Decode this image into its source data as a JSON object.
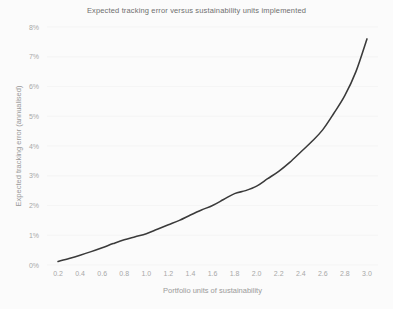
{
  "chart_data": {
    "type": "line",
    "title": "Expected tracking error versus sustainability units implemented",
    "xlabel": "Portfolio units of sustainability",
    "ylabel": "Expected tracking error (annualised)",
    "xlim": [
      0.1,
      3.1
    ],
    "ylim": [
      0,
      8
    ],
    "grid": true,
    "legend": "none",
    "x_tick_labels": [
      "0.2",
      "0.4",
      "0.6",
      "0.8",
      "1.0",
      "1.2",
      "1.4",
      "1.6",
      "1.8",
      "2.0",
      "2.2",
      "2.4",
      "2.6",
      "2.8",
      "3.0"
    ],
    "x_tick_values": [
      0.2,
      0.4,
      0.6,
      0.8,
      1.0,
      1.2,
      1.4,
      1.6,
      1.8,
      2.0,
      2.2,
      2.4,
      2.6,
      2.8,
      3.0
    ],
    "y_tick_labels": [
      "0%",
      "1%",
      "2%",
      "3%",
      "4%",
      "5%",
      "6%",
      "7%",
      "8%"
    ],
    "y_tick_values": [
      0,
      1,
      2,
      3,
      4,
      5,
      6,
      7,
      8
    ],
    "series": [
      {
        "name": "Expected tracking error",
        "color": "#3a3a3a",
        "x": [
          0.2,
          0.3,
          0.4,
          0.5,
          0.6,
          0.7,
          0.8,
          0.9,
          1.0,
          1.1,
          1.2,
          1.3,
          1.4,
          1.5,
          1.6,
          1.7,
          1.8,
          1.9,
          2.0,
          2.1,
          2.2,
          2.3,
          2.4,
          2.5,
          2.6,
          2.7,
          2.8,
          2.9,
          3.0
        ],
        "values": [
          0.12,
          0.22,
          0.33,
          0.45,
          0.58,
          0.72,
          0.85,
          0.95,
          1.05,
          1.2,
          1.35,
          1.5,
          1.68,
          1.85,
          2.0,
          2.2,
          2.4,
          2.5,
          2.65,
          2.9,
          3.15,
          3.45,
          3.8,
          4.15,
          4.55,
          5.1,
          5.7,
          6.5,
          7.6
        ]
      }
    ]
  }
}
